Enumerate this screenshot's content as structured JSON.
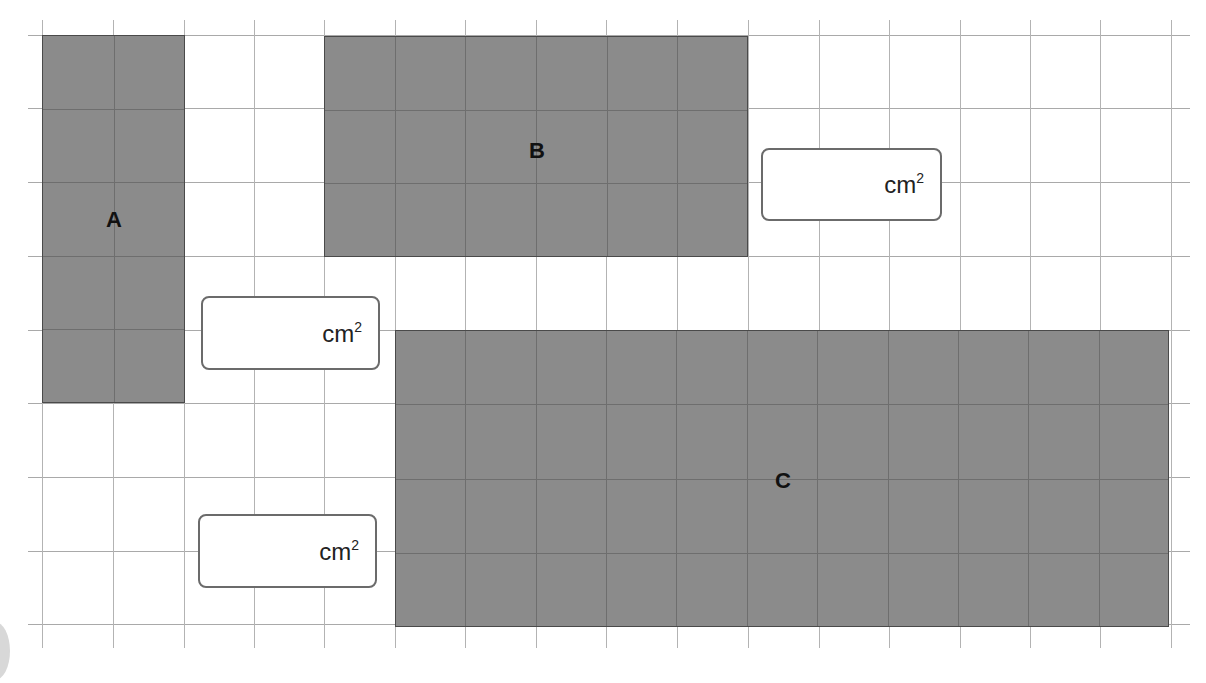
{
  "diagram": {
    "type": "area-grid-worksheet",
    "grid": {
      "columns_x": [
        42,
        113,
        184,
        254,
        324,
        395,
        465,
        536,
        606,
        677,
        748,
        819,
        889,
        960,
        1030,
        1100,
        1171
      ],
      "rows_y": [
        35,
        108,
        182,
        256,
        330,
        403,
        477,
        551,
        624
      ],
      "extent": {
        "left": 28,
        "right": 1190,
        "top": 20,
        "bottom": 648
      },
      "line_color": "#a9a9a9"
    },
    "fill_color": "#8b8b8b",
    "shapes": [
      {
        "label": "A",
        "x": 42,
        "y": 35,
        "w": 143,
        "h": 368,
        "cols": 2,
        "rows": 5,
        "label_x": 114,
        "label_y": 220
      },
      {
        "label": "B",
        "x": 324,
        "y": 36,
        "w": 424,
        "h": 221,
        "cols": 6,
        "rows": 3,
        "label_x": 537,
        "label_y": 151
      },
      {
        "label": "C",
        "x": 395,
        "y": 330,
        "w": 774,
        "h": 297,
        "cols": 11,
        "rows": 4,
        "label_x": 783,
        "label_y": 481
      }
    ],
    "answer_boxes": [
      {
        "id": "answer-a",
        "x": 201,
        "y": 296,
        "w": 179,
        "h": 74,
        "value": "",
        "unit": "cm",
        "exponent": "2"
      },
      {
        "id": "answer-b",
        "x": 761,
        "y": 148,
        "w": 181,
        "h": 73,
        "value": "",
        "unit": "cm",
        "exponent": "2"
      },
      {
        "id": "answer-c",
        "x": 198,
        "y": 514,
        "w": 179,
        "h": 74,
        "value": "",
        "unit": "cm",
        "exponent": "2"
      }
    ]
  }
}
